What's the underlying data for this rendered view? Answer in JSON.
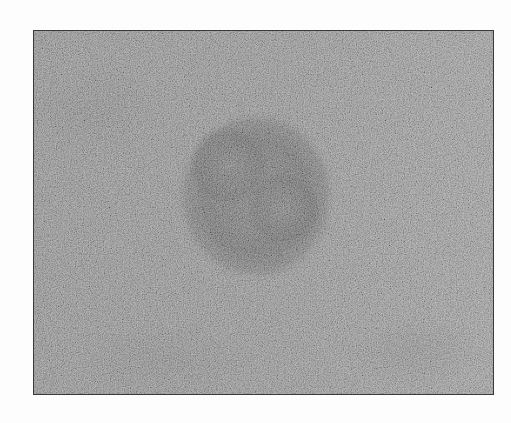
{
  "image": {
    "kind": "grayscale micrograph",
    "frame": {
      "left": 33,
      "top": 30,
      "width": 459,
      "height": 363,
      "border_color": "#3a3a3a"
    },
    "colors": {
      "page_background": "#fdfdfd",
      "field_base": "#8e8e8e",
      "field_light": "#999999",
      "field_dark_patch": "#7f7f7f",
      "particle_core": "#6a6a6a",
      "particle_rim": "#555555",
      "speckle_light": "#c8c8c8"
    },
    "particle": {
      "center_x": 222,
      "center_y": 165,
      "radius_x": 72,
      "radius_y": 80,
      "inner_rings": [
        {
          "cx": 195,
          "cy": 135,
          "r": 38
        },
        {
          "cx": 250,
          "cy": 175,
          "r": 36
        }
      ]
    }
  }
}
